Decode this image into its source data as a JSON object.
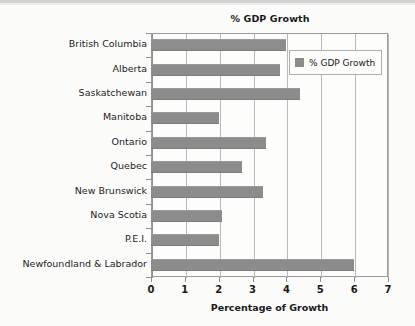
{
  "chart_data": {
    "type": "bar",
    "orientation": "horizontal",
    "title": "% GDP Growth",
    "xlabel": "Percentage of Growth",
    "ylabel": "",
    "xlim": [
      0,
      7
    ],
    "xticks": [
      "0",
      "1",
      "2",
      "3",
      "4",
      "5",
      "6",
      "7"
    ],
    "grid": true,
    "legend_position": "upper-right",
    "legend": [
      "% GDP Growth"
    ],
    "bar_color": "#8c8c8c",
    "categories": [
      "British Columbia",
      "Alberta",
      "Saskatchewan",
      "Manitoba",
      "Ontario",
      "Quebec",
      "New Brunswick",
      "Nova Scotia",
      "P.E.I.",
      "Newfoundland & Labrador"
    ],
    "series": [
      {
        "name": "% GDP Growth",
        "values": [
          4.0,
          3.8,
          4.4,
          2.0,
          3.4,
          2.7,
          3.3,
          2.1,
          2.0,
          6.0
        ]
      }
    ]
  }
}
